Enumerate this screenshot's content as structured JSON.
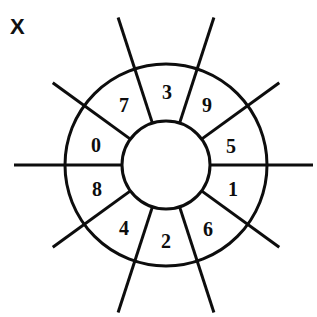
{
  "figure": {
    "corner_label": "X",
    "background_color": "#ffffff",
    "stroke_color": "#0d0d0d"
  },
  "chart_data": {
    "type": "pie",
    "title": "X",
    "xlabel": "",
    "ylabel": "",
    "subtitle": "",
    "legend_position": "none",
    "grid": false,
    "geometry": {
      "center_x": 166,
      "center_y": 165,
      "inner_radius": 44,
      "outer_radius": 101,
      "spoke_outer_radius": 152,
      "sector_count": 10,
      "sector_angle_degrees": 36,
      "angle_offset_degrees": 0,
      "stroke_width": 3
    },
    "categories": [
      "0",
      "1",
      "2",
      "3",
      "4",
      "5",
      "6",
      "7",
      "8",
      "9"
    ],
    "values": [
      36,
      36,
      36,
      36,
      36,
      36,
      36,
      36,
      36,
      36
    ],
    "sectors": [
      {
        "label": "5",
        "angle_start_deg": 0,
        "angle_end_deg": 36,
        "label_angle_deg": 18,
        "label_x": 231,
        "label_y": 146
      },
      {
        "label": "9",
        "angle_start_deg": 36,
        "angle_end_deg": 72,
        "label_angle_deg": 54,
        "label_y": 105,
        "label_x": 207
      },
      {
        "label": "3",
        "angle_start_deg": 72,
        "angle_end_deg": 108,
        "label_angle_deg": 90,
        "label_x": 167,
        "label_y": 92
      },
      {
        "label": "7",
        "angle_start_deg": 108,
        "angle_end_deg": 144,
        "label_angle_deg": 126,
        "label_x": 124,
        "label_y": 105
      },
      {
        "label": "0",
        "angle_start_deg": 144,
        "angle_end_deg": 180,
        "label_angle_deg": 162,
        "label_x": 96,
        "label_y": 145
      },
      {
        "label": "8",
        "angle_start_deg": 180,
        "angle_end_deg": 216,
        "label_angle_deg": 198,
        "label_x": 97,
        "label_y": 189
      },
      {
        "label": "4",
        "angle_start_deg": 216,
        "angle_end_deg": 252,
        "label_angle_deg": 234,
        "label_x": 124,
        "label_y": 228
      },
      {
        "label": "2",
        "angle_start_deg": 252,
        "angle_end_deg": 288,
        "label_angle_deg": 270,
        "label_x": 166,
        "label_y": 241
      },
      {
        "label": "6",
        "angle_start_deg": 288,
        "angle_end_deg": 324,
        "label_angle_deg": 306,
        "label_x": 208,
        "label_y": 229
      },
      {
        "label": "1",
        "angle_start_deg": 324,
        "angle_end_deg": 360,
        "label_angle_deg": 342,
        "label_x": 233,
        "label_y": 189
      }
    ],
    "spokes": [
      {
        "angle_deg": 0,
        "inner_radius": 44,
        "outer_radius": 147
      },
      {
        "angle_deg": 36,
        "inner_radius": 44,
        "outer_radius": 140
      },
      {
        "angle_deg": 72,
        "inner_radius": 44,
        "outer_radius": 155
      },
      {
        "angle_deg": 108,
        "inner_radius": 44,
        "outer_radius": 155
      },
      {
        "angle_deg": 144,
        "inner_radius": 44,
        "outer_radius": 140
      },
      {
        "angle_deg": 180,
        "inner_radius": 44,
        "outer_radius": 152
      },
      {
        "angle_deg": 216,
        "inner_radius": 44,
        "outer_radius": 140
      },
      {
        "angle_deg": 252,
        "inner_radius": 44,
        "outer_radius": 155
      },
      {
        "angle_deg": 288,
        "inner_radius": 44,
        "outer_radius": 155
      },
      {
        "angle_deg": 324,
        "inner_radius": 44,
        "outer_radius": 140
      }
    ]
  }
}
